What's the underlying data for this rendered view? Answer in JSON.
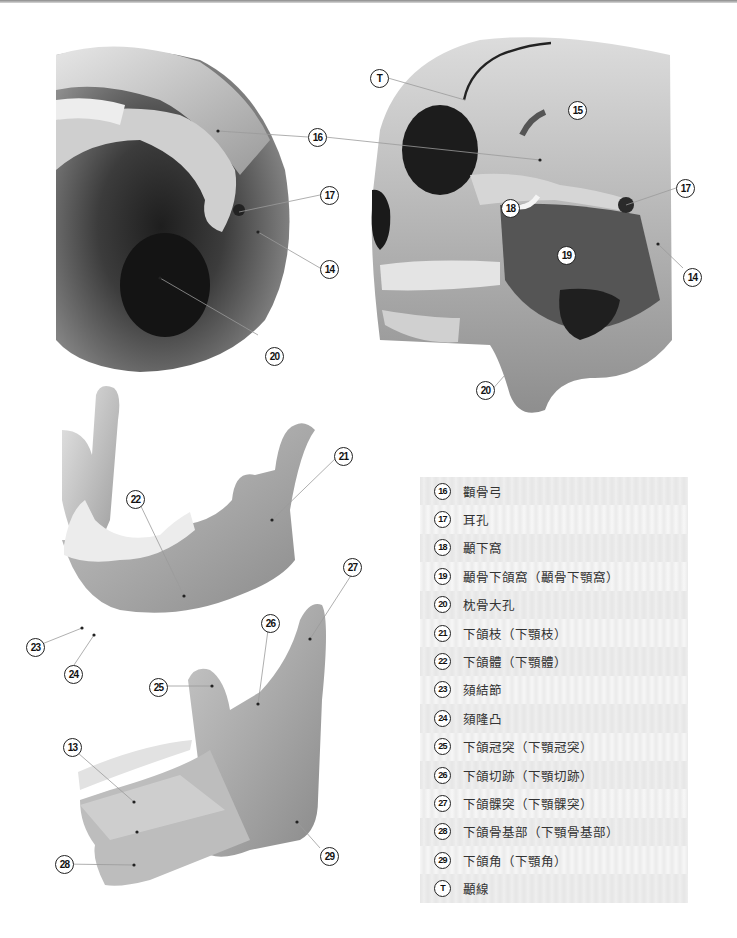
{
  "figure": {
    "callouts": [
      {
        "id": "16",
        "label": "16"
      },
      {
        "id": "17a",
        "label": "17"
      },
      {
        "id": "14a",
        "label": "14"
      },
      {
        "id": "20a",
        "label": "20"
      },
      {
        "id": "T",
        "label": "T"
      },
      {
        "id": "15",
        "label": "15"
      },
      {
        "id": "17b",
        "label": "17"
      },
      {
        "id": "18",
        "label": "18"
      },
      {
        "id": "19",
        "label": "19"
      },
      {
        "id": "14b",
        "label": "14"
      },
      {
        "id": "20b",
        "label": "20"
      },
      {
        "id": "21",
        "label": "21"
      },
      {
        "id": "22",
        "label": "22"
      },
      {
        "id": "27",
        "label": "27"
      },
      {
        "id": "26",
        "label": "26"
      },
      {
        "id": "23",
        "label": "23"
      },
      {
        "id": "24",
        "label": "24"
      },
      {
        "id": "25",
        "label": "25"
      },
      {
        "id": "13",
        "label": "13"
      },
      {
        "id": "28",
        "label": "28"
      },
      {
        "id": "29",
        "label": "29"
      }
    ]
  },
  "legend": {
    "rows": [
      {
        "num": "16",
        "text": "顴骨弓"
      },
      {
        "num": "17",
        "text": "耳孔"
      },
      {
        "num": "18",
        "text": "顳下窩"
      },
      {
        "num": "19",
        "text": "顳骨下頜窩（顳骨下顎窩）"
      },
      {
        "num": "20",
        "text": "枕骨大孔"
      },
      {
        "num": "21",
        "text": "下頜枝（下顎枝）"
      },
      {
        "num": "22",
        "text": "下頜體（下顎體）"
      },
      {
        "num": "23",
        "text": "頦結節"
      },
      {
        "num": "24",
        "text": "頦隆凸"
      },
      {
        "num": "25",
        "text": "下頜冠突（下顎冠突）"
      },
      {
        "num": "26",
        "text": "下頜切跡（下顎切跡）"
      },
      {
        "num": "27",
        "text": "下頜髁突（下顎髁突）"
      },
      {
        "num": "28",
        "text": "下頜骨基部（下顎骨基部）"
      },
      {
        "num": "29",
        "text": "下頜角（下顎角）"
      },
      {
        "num": "T",
        "text": "顳線"
      }
    ]
  },
  "colors": {
    "bone_light": "#e2e2e2",
    "bone_mid": "#a8a8a8",
    "bone_dark": "#3a3a3a",
    "legend_shade": "#e6e6e6",
    "legend_light": "#f7f7f7"
  }
}
